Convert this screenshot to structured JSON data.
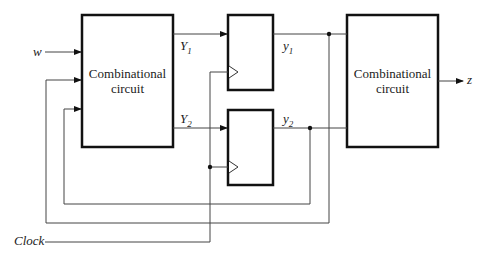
{
  "diagram": {
    "blocks": {
      "left_comb": {
        "line1": "Combinational",
        "line2": "circuit"
      },
      "right_comb": {
        "line1": "Combinational",
        "line2": "circuit"
      },
      "ff1": {
        "label": "flip-flop 1"
      },
      "ff2": {
        "label": "flip-flop 2"
      }
    },
    "signals": {
      "input": "w",
      "output": "z",
      "next_state_1": {
        "base": "Y",
        "sub": "1"
      },
      "next_state_2": {
        "base": "Y",
        "sub": "2"
      },
      "state_1": {
        "base": "y",
        "sub": "1"
      },
      "state_2": {
        "base": "y",
        "sub": "2"
      },
      "clock": "Clock"
    },
    "colors": {
      "line": "#222222",
      "box_border": "#111111",
      "thin_line": "#555555"
    }
  }
}
